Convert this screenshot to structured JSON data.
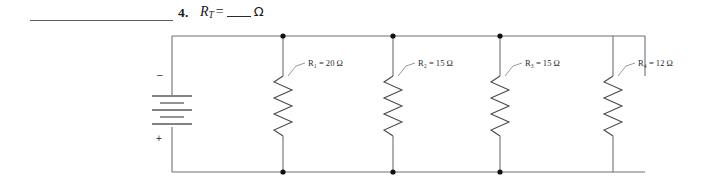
{
  "page": {
    "background": "#ffffff",
    "wire_color": "#5a6166",
    "component_color": "#4a4a4a"
  },
  "header": {
    "answer_blank": "",
    "question_number": "4.",
    "quantity": "R",
    "quantity_subscript": "T",
    "equals": "=",
    "answer_fill": "",
    "unit": "Ω"
  },
  "circuit": {
    "type": "parallel-resistor-circuit",
    "source": {
      "name": "battery",
      "negative_terminal": "–",
      "positive_terminal": "+"
    },
    "branches": [
      {
        "designator": "R",
        "subscript": "1",
        "equals": "=",
        "value": "20",
        "unit": "Ω",
        "label": "R₁ = 20 Ω"
      },
      {
        "designator": "R",
        "subscript": "2",
        "equals": "=",
        "value": "15",
        "unit": "Ω",
        "label": "R₂ = 15 Ω"
      },
      {
        "designator": "R",
        "subscript": "3",
        "equals": "=",
        "value": "15",
        "unit": "Ω",
        "label": "R₃ = 15 Ω"
      },
      {
        "designator": "R",
        "subscript": "4",
        "equals": "=",
        "value": "12",
        "unit": "Ω",
        "label": "R₄ = 12 Ω"
      }
    ],
    "nodes_top": 3,
    "nodes_bottom": 3
  }
}
